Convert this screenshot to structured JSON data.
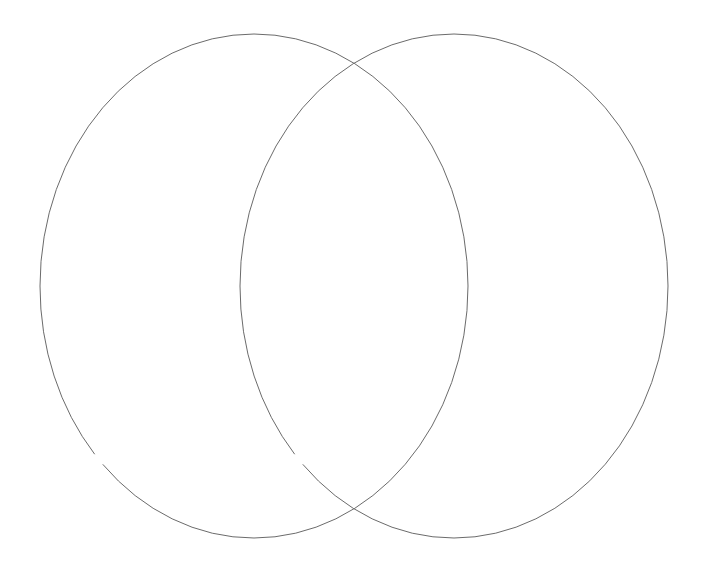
{
  "canvas": {
    "width": 706,
    "height": 571,
    "background_color": "#ffffff",
    "title": "Two overlapping ellipses"
  },
  "chart_data": {
    "type": "diagram",
    "subtype": "venn-two-set",
    "title": "",
    "subtitle": "",
    "xlabel": "",
    "ylabel": "",
    "legend": [],
    "annotations": [],
    "grid": false,
    "background_color": "#ffffff",
    "shapes": [
      {
        "id": "left-ellipse",
        "kind": "ellipse",
        "label": "",
        "cx": 254,
        "cy": 286,
        "rx": 214,
        "ry": 252,
        "stroke_color": "#6b6b6b",
        "stroke_width": 1,
        "fill": "none",
        "dash_pattern": "1100 13",
        "dash_offset": 560
      },
      {
        "id": "right-ellipse",
        "kind": "ellipse",
        "label": "",
        "cx": 454,
        "cy": 286,
        "rx": 214,
        "ry": 252,
        "stroke_color": "#6b6b6b",
        "stroke_width": 1,
        "fill": "none",
        "dash_pattern": "1100 13",
        "dash_offset": 560
      }
    ],
    "intersections": [
      {
        "id": "upper-crossing",
        "x": 354,
        "y": 73
      },
      {
        "id": "lower-crossing",
        "x": 354,
        "y": 513
      }
    ],
    "extents": {
      "left_ellipse": {
        "x_min": 40,
        "x_max": 468,
        "y_min": 34,
        "y_max": 538
      },
      "right_ellipse": {
        "x_min": 240,
        "x_max": 668,
        "y_min": 34,
        "y_max": 538
      }
    }
  },
  "style": {
    "stroke_color": "#6b6b6b",
    "stroke_width": 1,
    "fill": "none"
  }
}
